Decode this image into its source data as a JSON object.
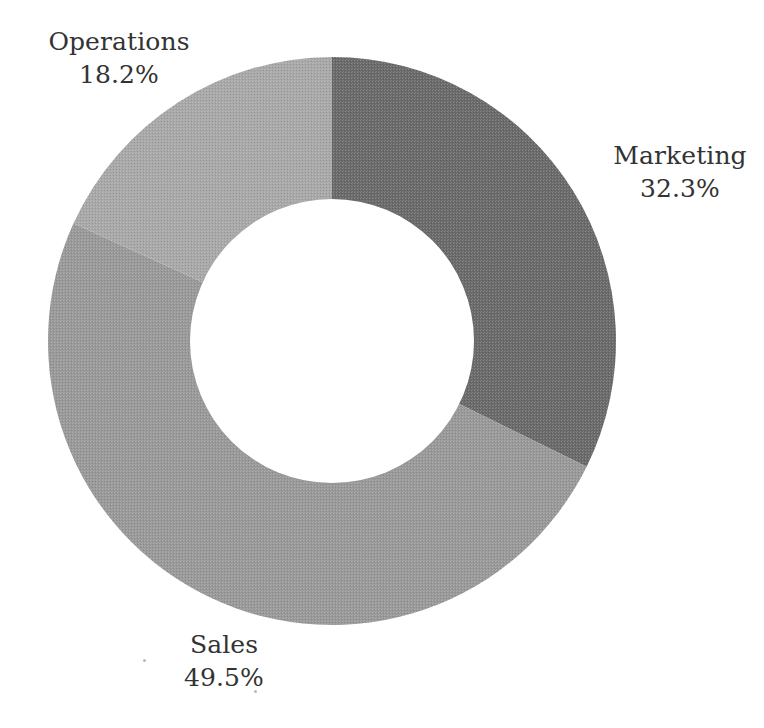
{
  "chart_data": {
    "type": "pie",
    "variant": "donut",
    "title": "",
    "subtitle": "",
    "xlabel": "",
    "ylabel": "",
    "legend_position": "none",
    "grid": false,
    "labels_outside": true,
    "hole_ratio": 0.5,
    "start_angle_deg": 0,
    "direction": "clockwise",
    "background_color": "#ffffff",
    "label_text_color": "#333333",
    "categories": [
      "Marketing",
      "Sales",
      "Operations"
    ],
    "values": [
      32.3,
      49.5,
      18.2
    ],
    "value_suffix": "%",
    "slices": [
      {
        "name": "Marketing",
        "label": "Marketing",
        "value": 32.3,
        "value_text": "32.3%",
        "color": "#6a6a6a",
        "start_angle_deg": 0.0,
        "end_angle_deg": 116.28
      },
      {
        "name": "Sales",
        "label": "Sales",
        "value": 49.5,
        "value_text": "49.5%",
        "color": "#999999",
        "start_angle_deg": 116.28,
        "end_angle_deg": 294.48
      },
      {
        "name": "Operations",
        "label": "Operations",
        "value": 18.2,
        "value_text": "18.2%",
        "color": "#a8a8a8",
        "start_angle_deg": 294.48,
        "end_angle_deg": 360.0
      }
    ]
  },
  "labels": {
    "operations": {
      "name": "Operations",
      "value_text": "18.2%"
    },
    "marketing": {
      "name": "Marketing",
      "value_text": "32.3%"
    },
    "sales": {
      "name": "Sales",
      "value_text": "49.5%"
    }
  }
}
